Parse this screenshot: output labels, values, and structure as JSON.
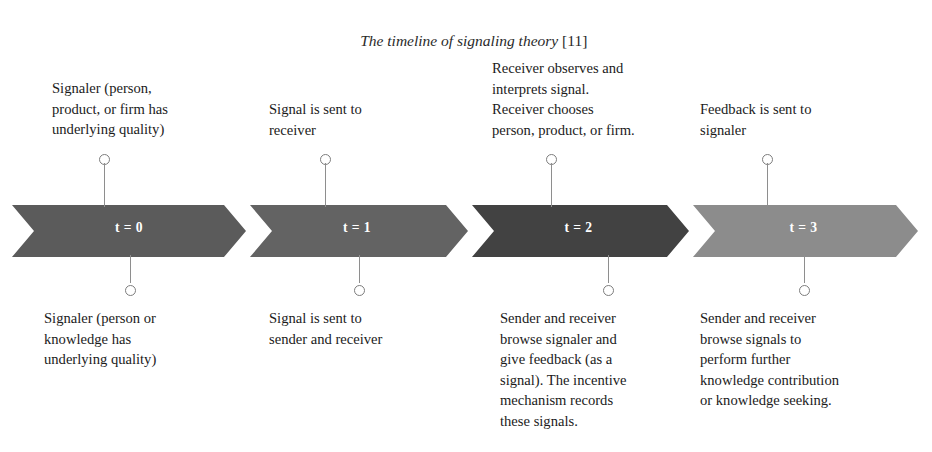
{
  "figure": {
    "title": "The timeline of signaling theory",
    "title_reference": "[11]",
    "background": "#ffffff",
    "text_color": "#1b1b1b"
  },
  "band": {
    "left": 12,
    "right": 918,
    "top": 205,
    "bottom": 257,
    "notch": 22,
    "colors": [
      "#5b5b5b",
      "#636363",
      "#424242",
      "#8c8c8c"
    ],
    "segment_boundaries": [
      12,
      246,
      468,
      689,
      918
    ]
  },
  "stages": [
    {
      "id": "t0",
      "t_label": "t = 0",
      "color": "#5b5b5b",
      "pin_x": 104,
      "above": {
        "lines": [
          "Signaler (person,",
          "product, or firm has",
          "underlying quality)"
        ],
        "x": 52,
        "y": 78
      },
      "below": {
        "lines": [
          "Signaler (person or",
          "knowledge has",
          "underlying quality)"
        ],
        "x": 44,
        "y": 308
      },
      "pin_above": {
        "x": 104,
        "ring_top": 154,
        "stem_height": 52
      },
      "pin_below": {
        "x": 130,
        "ring_bottom": 161,
        "stem_height": 28
      }
    },
    {
      "id": "t1",
      "t_label": "t = 1",
      "color": "#636363",
      "pin_x": 325,
      "above": {
        "lines": [
          "Signal is sent to",
          "receiver"
        ],
        "x": 269,
        "y": 99
      },
      "below": {
        "lines": [
          "Signal is sent to",
          "sender and receiver"
        ],
        "x": 269,
        "y": 308
      },
      "pin_above": {
        "x": 325,
        "ring_top": 154,
        "stem_height": 52
      },
      "pin_below": {
        "x": 359,
        "ring_bottom": 161,
        "stem_height": 28
      }
    },
    {
      "id": "t2",
      "t_label": "t = 2",
      "color": "#424242",
      "pin_x": 551,
      "above": {
        "lines": [
          "Receiver observes and",
          "interprets signal.",
          "Receiver chooses",
          "person, product, or firm."
        ],
        "x": 492,
        "y": 58
      },
      "below": {
        "lines": [
          "Sender and receiver",
          "browse signaler and",
          "give feedback (as a",
          "signal). The incentive",
          "mechanism records",
          "these signals."
        ],
        "x": 500,
        "y": 308
      },
      "pin_above": {
        "x": 551,
        "ring_top": 154,
        "stem_height": 52
      },
      "pin_below": {
        "x": 608,
        "ring_bottom": 161,
        "stem_height": 28
      }
    },
    {
      "id": "t3",
      "t_label": "t = 3",
      "color": "#8c8c8c",
      "pin_x": 767,
      "above": {
        "lines": [
          "Feedback is sent to",
          "signaler"
        ],
        "x": 700,
        "y": 99
      },
      "below": {
        "lines": [
          "Sender and receiver",
          "browse signals to",
          "perform further",
          "knowledge contribution",
          "or knowledge seeking."
        ],
        "x": 700,
        "y": 308
      },
      "pin_above": {
        "x": 767,
        "ring_top": 154,
        "stem_height": 52
      },
      "pin_below": {
        "x": 804,
        "ring_bottom": 161,
        "stem_height": 28
      }
    }
  ]
}
